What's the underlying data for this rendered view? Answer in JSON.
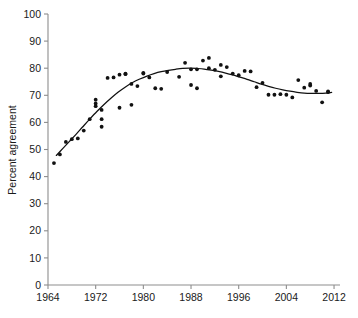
{
  "chart_data": {
    "type": "scatter",
    "title": "",
    "xlabel": "",
    "ylabel": "Percent agreement",
    "xlim": [
      1964,
      2013
    ],
    "ylim": [
      0,
      100
    ],
    "grid": false,
    "legend": "none",
    "x_ticks": [
      1964,
      1972,
      1980,
      1988,
      1996,
      2004,
      2012
    ],
    "y_ticks": [
      0,
      10,
      20,
      30,
      40,
      50,
      60,
      70,
      80,
      90,
      100
    ],
    "series": [
      {
        "name": "Percent agreement",
        "marker": "filled-circle",
        "color": "#111111",
        "points": [
          [
            1965,
            45.0
          ],
          [
            1966,
            48.2
          ],
          [
            1967,
            52.8
          ],
          [
            1968,
            53.8
          ],
          [
            1969,
            54.1
          ],
          [
            1970,
            57.0
          ],
          [
            1971,
            61.2
          ],
          [
            1972,
            68.4
          ],
          [
            1972,
            67.0
          ],
          [
            1972,
            66.0
          ],
          [
            1973,
            64.6
          ],
          [
            1973,
            61.2
          ],
          [
            1973,
            58.4
          ],
          [
            1974,
            76.4
          ],
          [
            1975,
            76.6
          ],
          [
            1976,
            77.6
          ],
          [
            1976,
            65.4
          ],
          [
            1977,
            78.0
          ],
          [
            1977,
            77.8
          ],
          [
            1978,
            74.2
          ],
          [
            1978,
            66.5
          ],
          [
            1979,
            73.4
          ],
          [
            1980,
            78.3
          ],
          [
            1980,
            78.0
          ],
          [
            1981,
            76.6
          ],
          [
            1982,
            72.6
          ],
          [
            1983,
            72.4
          ],
          [
            1984,
            78.6
          ],
          [
            1986,
            76.8
          ],
          [
            1987,
            82.0
          ],
          [
            1988,
            79.6
          ],
          [
            1988,
            73.8
          ],
          [
            1989,
            79.6
          ],
          [
            1989,
            72.6
          ],
          [
            1990,
            82.8
          ],
          [
            1991,
            83.8
          ],
          [
            1991,
            80.0
          ],
          [
            1992,
            79.4
          ],
          [
            1993,
            81.2
          ],
          [
            1993,
            77.0
          ],
          [
            1994,
            80.4
          ],
          [
            1995,
            78.0
          ],
          [
            1996,
            77.4
          ],
          [
            1997,
            79.0
          ],
          [
            1998,
            78.8
          ],
          [
            1999,
            73.0
          ],
          [
            2000,
            74.6
          ],
          [
            2001,
            70.2
          ],
          [
            2002,
            70.2
          ],
          [
            2003,
            70.4
          ],
          [
            2004,
            70.2
          ],
          [
            2005,
            69.2
          ],
          [
            2006,
            75.6
          ],
          [
            2007,
            72.8
          ],
          [
            2008,
            73.6
          ],
          [
            2008,
            74.2
          ],
          [
            2009,
            71.6
          ],
          [
            2010,
            67.4
          ],
          [
            2011,
            71.4
          ],
          [
            2011,
            71.2
          ]
        ]
      }
    ],
    "trend_line": {
      "name": "smoothed fit",
      "color": "#111111",
      "points": [
        [
          1965.4,
          47.8
        ],
        [
          1966.5,
          50.4
        ],
        [
          1967.6,
          53.0
        ],
        [
          1968.7,
          55.6
        ],
        [
          1969.8,
          58.3
        ],
        [
          1971.0,
          61.2
        ],
        [
          1972.2,
          64.0
        ],
        [
          1973.4,
          66.6
        ],
        [
          1974.6,
          69.0
        ],
        [
          1975.8,
          71.2
        ],
        [
          1977.0,
          73.1
        ],
        [
          1978.2,
          74.7
        ],
        [
          1979.4,
          76.0
        ],
        [
          1980.6,
          77.1
        ],
        [
          1981.8,
          78.0
        ],
        [
          1983.0,
          78.7
        ],
        [
          1984.2,
          79.2
        ],
        [
          1985.4,
          79.6
        ],
        [
          1986.6,
          79.9
        ],
        [
          1987.8,
          80.0
        ],
        [
          1989.0,
          79.9
        ],
        [
          1990.2,
          79.7
        ],
        [
          1991.4,
          79.3
        ],
        [
          1992.6,
          78.8
        ],
        [
          1993.8,
          78.2
        ],
        [
          1995.0,
          77.5
        ],
        [
          1996.2,
          76.7
        ],
        [
          1997.4,
          75.9
        ],
        [
          1998.6,
          75.0
        ],
        [
          1999.8,
          74.1
        ],
        [
          2001.0,
          73.3
        ],
        [
          2002.2,
          72.6
        ],
        [
          2003.4,
          72.0
        ],
        [
          2004.6,
          71.5
        ],
        [
          2005.8,
          71.1
        ],
        [
          2007.0,
          70.8
        ],
        [
          2008.2,
          70.7
        ],
        [
          2009.4,
          70.7
        ],
        [
          2010.6,
          70.8
        ],
        [
          2011.6,
          71.1
        ]
      ]
    }
  },
  "figure": {
    "y_axis_title": "Percent agreement",
    "caption_fragment": ""
  }
}
